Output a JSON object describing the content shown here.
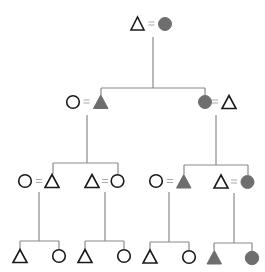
{
  "diagram": {
    "type": "kinship-pedigree",
    "legend": {
      "triangle": "male",
      "circle": "female",
      "equals": "marriage",
      "filled": "shaded individual",
      "open": "unshaded individual"
    },
    "colors": {
      "filled": "#6e6e6e",
      "outline": "#1a1a1a",
      "line": "#8a8a8a",
      "background": "#ffffff"
    },
    "generations": [
      {
        "level": 1,
        "couples": [
          {
            "id": "g1c1",
            "left": {
              "shape": "triangle",
              "filled": false
            },
            "right": {
              "shape": "circle",
              "filled": true
            }
          }
        ]
      },
      {
        "level": 2,
        "couples": [
          {
            "id": "g2c1",
            "left": {
              "shape": "circle",
              "filled": false
            },
            "right": {
              "shape": "triangle",
              "filled": true
            }
          },
          {
            "id": "g2c2",
            "left": {
              "shape": "circle",
              "filled": true
            },
            "right": {
              "shape": "triangle",
              "filled": false
            }
          }
        ]
      },
      {
        "level": 3,
        "couples": [
          {
            "id": "g3c1",
            "left": {
              "shape": "circle",
              "filled": false
            },
            "right": {
              "shape": "triangle",
              "filled": false
            }
          },
          {
            "id": "g3c2",
            "left": {
              "shape": "triangle",
              "filled": false
            },
            "right": {
              "shape": "circle",
              "filled": false
            }
          },
          {
            "id": "g3c3",
            "left": {
              "shape": "circle",
              "filled": false
            },
            "right": {
              "shape": "triangle",
              "filled": true
            }
          },
          {
            "id": "g3c4",
            "left": {
              "shape": "triangle",
              "filled": false
            },
            "right": {
              "shape": "circle",
              "filled": true
            }
          }
        ]
      },
      {
        "level": 4,
        "sibling_groups": [
          {
            "id": "g4s1",
            "children": [
              {
                "shape": "triangle",
                "filled": false
              },
              {
                "shape": "circle",
                "filled": false
              }
            ]
          },
          {
            "id": "g4s2",
            "children": [
              {
                "shape": "triangle",
                "filled": false
              },
              {
                "shape": "circle",
                "filled": false
              }
            ]
          },
          {
            "id": "g4s3",
            "children": [
              {
                "shape": "triangle",
                "filled": false
              },
              {
                "shape": "circle",
                "filled": false
              }
            ]
          },
          {
            "id": "g4s4",
            "children": [
              {
                "shape": "triangle",
                "filled": true
              },
              {
                "shape": "circle",
                "filled": true
              }
            ]
          }
        ]
      }
    ]
  }
}
